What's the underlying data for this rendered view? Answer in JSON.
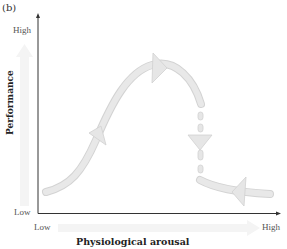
{
  "figure": {
    "panel_label": "(b)",
    "y_axis": {
      "label": "Performance",
      "high_label": "High",
      "low_label": "Low"
    },
    "x_axis": {
      "label": "Physiological arousal",
      "low_label": "Low",
      "high_label": "High"
    },
    "curve": {
      "description": "Inverted-U / catastrophe curve: performance rises with arousal to a peak, then drops sharply (dashed arrow down) to a low level; return path at high arousal moves leftward along the low branch",
      "rising_branch_arrow": "up-right",
      "peak_arrow": "right",
      "drop_arrow": "down",
      "lower_branch_arrow": "left"
    },
    "colors": {
      "axis": "#333333",
      "curve_fill": "#e6e6e6",
      "curve_edge": "#d2d2d2",
      "background_arrow": "#f3f3f3"
    }
  }
}
